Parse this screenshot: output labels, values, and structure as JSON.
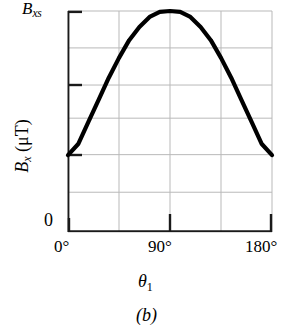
{
  "figure": {
    "caption": "(b)",
    "background_color": "#ffffff",
    "curve_color": "#000000",
    "grid_color": "#b9b9b9",
    "axis_color": "#1a1a1a"
  },
  "axes": {
    "y": {
      "title_symbol": "B",
      "title_subscript": "x",
      "title_units": "(μT)",
      "top_tick_label_symbol": "B",
      "top_tick_label_subscript": "xs",
      "origin_label": "0"
    },
    "x": {
      "title_symbol": "θ",
      "title_subscript": "1",
      "tick_labels": [
        "0°",
        "90°",
        "180°"
      ]
    }
  },
  "chart_data": {
    "type": "line",
    "title": "",
    "xlabel": "θ₁",
    "ylabel": "Bₓ (μT)",
    "xlim": [
      0,
      180
    ],
    "ylim": [
      0,
      1
    ],
    "xticks": [
      0,
      90,
      180
    ],
    "xticklabels": [
      "0°",
      "90°",
      "180°"
    ],
    "yticks": [
      0,
      0.35,
      0.665,
      1.0
    ],
    "yticklabels": [
      "0",
      "",
      "",
      "B_xs"
    ],
    "grid": true,
    "gridlines_x": [
      0,
      45,
      90,
      135,
      180
    ],
    "gridlines_y": [
      0.0,
      0.18,
      0.35,
      0.515,
      0.665,
      0.833,
      1.0
    ],
    "legend": null,
    "annotations": [],
    "series": [
      {
        "name": "B_x vs theta_1",
        "x": [
          0,
          9,
          18,
          27,
          36,
          45,
          54,
          63,
          72,
          81,
          90,
          99,
          108,
          117,
          126,
          135,
          144,
          153,
          162,
          171,
          180
        ],
        "y": [
          0.348,
          0.398,
          0.498,
          0.598,
          0.698,
          0.788,
          0.868,
          0.928,
          0.973,
          0.996,
          1.0,
          0.996,
          0.973,
          0.928,
          0.868,
          0.788,
          0.698,
          0.598,
          0.498,
          0.398,
          0.348
        ]
      }
    ]
  }
}
